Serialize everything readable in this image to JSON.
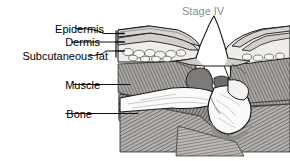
{
  "figure": {
    "title": "Stage IV",
    "title_color": "#8d8d8d",
    "background_color": "#ffffff",
    "label_color": "#000000"
  },
  "labels": {
    "epidermis": "Epidermis",
    "dermis": "Dermis",
    "subcutaneous_fat": "Subcutaneous fat",
    "muscle": "Muscle",
    "bone": "Bone"
  },
  "anatomy": {
    "epidermis_name": "epidermis-layer",
    "dermis_name": "dermis-layer",
    "fat_name": "subcutaneous-fat-layer",
    "muscle_name": "muscle-layer",
    "bone_name": "bone-structure",
    "wound_name": "stage-iv-ulcer-crater",
    "necrotic_name": "necrotic-tissue",
    "undermining_name": "undermined-skin-edge"
  },
  "palette": {
    "outline": "#1a1a1a",
    "skin_fill": "#e8e6e3",
    "fat_fill": "#f2f0ed",
    "dermis_fill": "#d8d5d1",
    "muscle_fill": "#a8a5a2",
    "muscle_shade": "#6e6b68",
    "bone_fill": "#fafafa",
    "bone_shade": "#d4d2cf",
    "necrotic_fill": "#7d7a77",
    "wound_bed": "#ffffff",
    "leader_line": "#111111"
  }
}
